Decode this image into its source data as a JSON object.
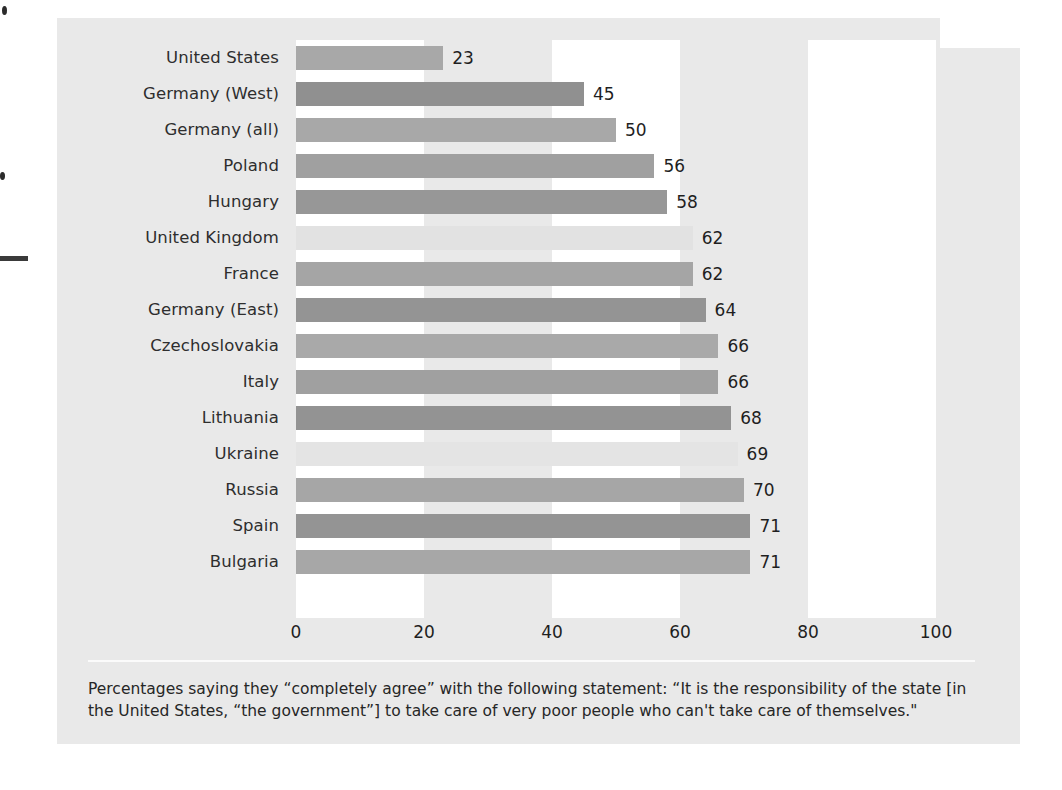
{
  "chart_data": {
    "type": "bar",
    "orientation": "horizontal",
    "title": "",
    "subtitle": "",
    "xlabel": "",
    "ylabel": "",
    "xlim": [
      0,
      100
    ],
    "xticks": [
      0,
      20,
      40,
      60,
      80,
      100
    ],
    "grid": "alternating vertical white bands at 0-20, 40-60, 80-100",
    "legend": "none",
    "value_label_suffix": "",
    "categories": [
      "United States",
      "Germany (West)",
      "Germany (all)",
      "Poland",
      "Hungary",
      "United Kingdom",
      "France",
      "Germany (East)",
      "Czechoslovakia",
      "Italy",
      "Lithuania",
      "Ukraine",
      "Russia",
      "Spain",
      "Bulgaria"
    ],
    "values": [
      23,
      45,
      50,
      56,
      58,
      62,
      62,
      64,
      66,
      66,
      68,
      69,
      70,
      71,
      71
    ],
    "bar_colors": [
      "#a8a8a8",
      "#909090",
      "#a8a8a8",
      "#a0a0a0",
      "#979797",
      "#e2e2e2",
      "#a5a5a5",
      "#949494",
      "#a9a9a9",
      "#a0a0a0",
      "#939393",
      "#e4e4e4",
      "#a6a6a6",
      "#949494",
      "#a7a7a7"
    ]
  },
  "caption": {
    "text": "Percentages saying they “completely agree” with the following statement: “It is the responsibility of the state [in the United States, “the government”] to take care of very poor people who can't take care of themselves.\""
  },
  "colors": {
    "panel_background": "#e9e9e9",
    "band_white": "#ffffff",
    "text": "#262626",
    "rule": "#fbfbfb"
  }
}
